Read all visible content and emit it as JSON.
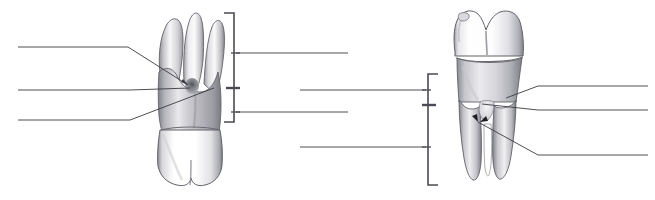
{
  "figure": {
    "caption": "",
    "background_color": "#ffffff",
    "line_color": "#3a3a42",
    "bracket_color": "#4a4a52",
    "width": 655,
    "height": 200
  },
  "specimens": [
    {
      "id": "left-tooth",
      "name": "maxillary-molar",
      "description_text": "",
      "orientation": "roots-up",
      "root_count": 3,
      "enamel_color": "#fbfbfb",
      "dentin_shadow_color": "#b9b9bd",
      "outline_color": "#5c5c63"
    },
    {
      "id": "right-tooth",
      "name": "mandibular-molar",
      "description_text": "",
      "orientation": "crown-up",
      "root_count": 2,
      "enamel_color": "#fcfcfc",
      "dentin_shadow_color": "#bcbcc0",
      "outline_color": "#5c5c63"
    }
  ],
  "left_leader_lines": [
    {
      "id": "L1",
      "label_text": "",
      "x1": 18,
      "y1": 47,
      "x2": 128,
      "y2": 47,
      "has_pointer": true,
      "pointer_x": 185,
      "pointer_y": 84
    },
    {
      "id": "L2",
      "label_text": "",
      "x1": 18,
      "y1": 90,
      "x2": 130,
      "y2": 90,
      "has_pointer": true,
      "pointer_x": 188,
      "pointer_y": 90
    },
    {
      "id": "L3",
      "label_text": "",
      "x1": 18,
      "y1": 120,
      "x2": 130,
      "y2": 120,
      "has_pointer": true,
      "pointer_x": 213,
      "pointer_y": 88
    }
  ],
  "middle_leader_lines": [
    {
      "id": "M1",
      "label_text": "",
      "x1": 234,
      "y1": 53,
      "x2": 348,
      "y2": 53
    },
    {
      "id": "M2",
      "label_text": "",
      "x1": 300,
      "y1": 90,
      "x2": 425,
      "y2": 90
    },
    {
      "id": "M3",
      "label_text": "",
      "x1": 234,
      "y1": 112,
      "x2": 348,
      "y2": 112
    },
    {
      "id": "M4",
      "label_text": "",
      "x1": 300,
      "y1": 147,
      "x2": 425,
      "y2": 147
    }
  ],
  "right_leader_lines": [
    {
      "id": "R1",
      "label_text": "",
      "x1": 538,
      "y1": 86,
      "x2": 648,
      "y2": 86,
      "has_pointer": true,
      "pointer_x": 508,
      "pointer_y": 97
    },
    {
      "id": "R2",
      "label_text": "",
      "x1": 538,
      "y1": 110,
      "x2": 648,
      "y2": 110,
      "has_pointer": true,
      "pointer_x": 478,
      "pointer_y": 104
    },
    {
      "id": "R3",
      "label_text": "",
      "x1": 538,
      "y1": 155,
      "x2": 648,
      "y2": 155,
      "has_pointer": true,
      "pointer_x": 478,
      "pointer_y": 122
    }
  ],
  "brackets": [
    {
      "id": "left-bracket",
      "label_text": "",
      "x": 234,
      "y_top": 13,
      "y_bottom": 122,
      "arm_length": 10,
      "opens": "right",
      "divider_y": 88,
      "tick_ys": [
        53,
        112
      ]
    },
    {
      "id": "right-bracket",
      "label_text": "",
      "x": 428,
      "y_top": 74,
      "y_bottom": 185,
      "arm_length": 10,
      "opens": "left",
      "divider_y": 105,
      "tick_ys": [
        90,
        147
      ]
    }
  ]
}
